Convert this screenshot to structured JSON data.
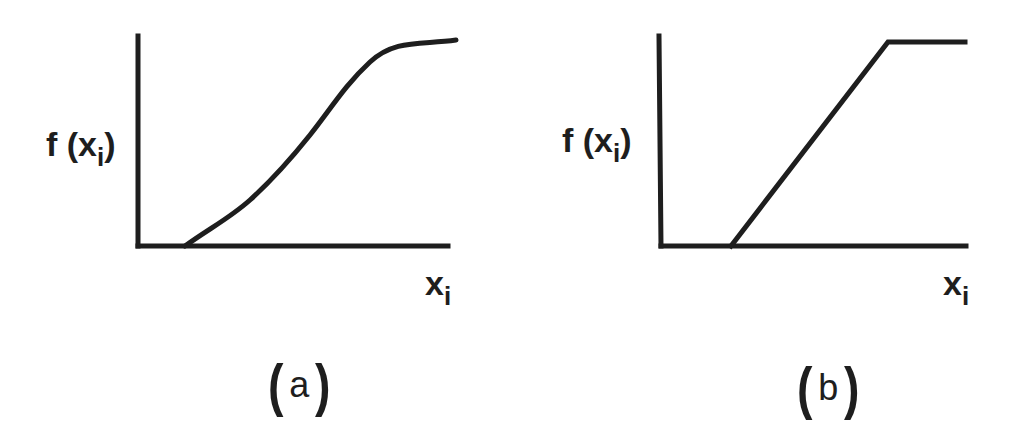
{
  "panels": [
    {
      "id": "a",
      "caption": "a",
      "ylabel": {
        "main": "f (x",
        "sub": "i",
        "close": ")"
      },
      "xlabel": {
        "main": "x",
        "sub": "i"
      },
      "curve": "sigmoid"
    },
    {
      "id": "b",
      "caption": "b",
      "ylabel": {
        "main": "f (x",
        "sub": "i",
        "close": ")"
      },
      "xlabel": {
        "main": "x",
        "sub": "i"
      },
      "curve": "piecewise-linear ramp with saturation"
    }
  ],
  "colors": {
    "ink": "#1e1e1e",
    "background": "#ffffff"
  }
}
